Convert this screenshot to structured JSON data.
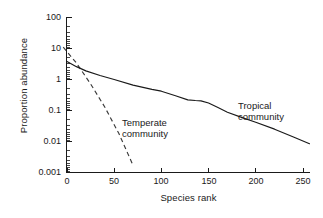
{
  "chart_data": {
    "type": "line",
    "title": "",
    "xlabel": "Species rank",
    "ylabel": "Proportion abundance",
    "xlim": [
      0,
      257
    ],
    "ylim": [
      0.001,
      100
    ],
    "yscale": "log",
    "xscale": "linear",
    "grid": false,
    "legend": "annotations-inline",
    "xticks": [
      "0",
      "50",
      "100",
      "150",
      "200",
      "250"
    ],
    "xtick_values": [
      0,
      50,
      100,
      150,
      200,
      250
    ],
    "yticks": [
      "100",
      "10",
      "1",
      "0.1",
      "0.01",
      "0.001"
    ],
    "ytick_values": [
      100,
      10,
      1,
      0.1,
      0.01,
      0.001
    ],
    "series": [
      {
        "name": "Tropical community",
        "style": "solid",
        "color": "#1a1a1a",
        "x": [
          0,
          10,
          20,
          35,
          50,
          70,
          90,
          100,
          115,
          128,
          136,
          142,
          150,
          160,
          170,
          185,
          200,
          220,
          240,
          257
        ],
        "values": [
          3.8,
          2.6,
          1.9,
          1.35,
          1.0,
          0.66,
          0.48,
          0.42,
          0.3,
          0.22,
          0.21,
          0.205,
          0.175,
          0.125,
          0.088,
          0.06,
          0.042,
          0.025,
          0.014,
          0.0085
        ]
      },
      {
        "name": "Temperate community",
        "style": "dashed",
        "color": "#3a3a3a",
        "x": [
          -4,
          10,
          25,
          40,
          55,
          70
        ],
        "values": [
          11.0,
          3.4,
          0.72,
          0.13,
          0.018,
          0.0017
        ]
      }
    ],
    "annotations": [
      {
        "text_line1": "Temperate",
        "text_line2": "community",
        "x": 60,
        "y": 0.055
      },
      {
        "text_line1": "Tropical",
        "text_line2": "community",
        "x": 185,
        "y": 0.16
      }
    ]
  },
  "axes": {
    "ylabel": "Proportion abundance",
    "xlabel": "Species rank",
    "yticks": [
      {
        "label": "100"
      },
      {
        "label": "10"
      },
      {
        "label": "1"
      },
      {
        "label": "0.1"
      },
      {
        "label": "0.01"
      },
      {
        "label": "0.001"
      }
    ],
    "xticks": [
      {
        "label": "0"
      },
      {
        "label": "50"
      },
      {
        "label": "100"
      },
      {
        "label": "150"
      },
      {
        "label": "200"
      },
      {
        "label": "250"
      }
    ]
  },
  "annotations": {
    "temperate": {
      "line1": "Temperate",
      "line2": "community"
    },
    "tropical": {
      "line1": "Tropical",
      "line2": "community"
    }
  },
  "colors": {
    "ink": "#1a1a1a",
    "dashed": "#3a3a3a",
    "background": "#ffffff"
  }
}
